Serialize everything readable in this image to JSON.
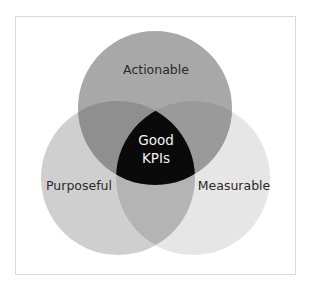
{
  "diagram": {
    "type": "venn",
    "sets": [
      {
        "id": "actionable",
        "label": "Actionable",
        "color": "#a8a8a8"
      },
      {
        "id": "purposeful",
        "label": "Purposeful",
        "color": "#cfcfcf"
      },
      {
        "id": "measurable",
        "label": "Measurable",
        "color": "#e6e6e6"
      }
    ],
    "overlaps": {
      "actionable_purposeful": {
        "color": "#8f8f8f"
      },
      "actionable_measurable": {
        "color": "#9a9a9a"
      },
      "purposeful_measurable": {
        "color": "#b4b4b4"
      }
    },
    "center": {
      "label_line1": "Good",
      "label_line2": "KPIs",
      "color": "#0a0a0a"
    },
    "frame_border_color": "#d9d9d9"
  }
}
